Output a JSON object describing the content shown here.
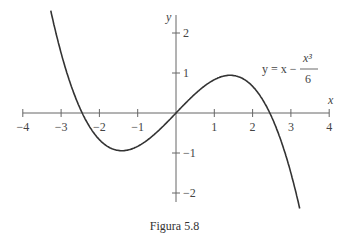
{
  "chart_data": {
    "type": "line",
    "title": "",
    "caption": "Figura 5.8",
    "function": "y = x - x^3/6",
    "annotation": {
      "lhs": "y = x −",
      "numerator": "x³",
      "denominator": "6"
    },
    "xlabel": "x",
    "ylabel": "y",
    "xlim": [
      -4,
      4
    ],
    "ylim": [
      -2.5,
      2.5
    ],
    "x_ticks": [
      -4,
      -3,
      -2,
      -1,
      1,
      2,
      3,
      4
    ],
    "x_tick_labels": [
      "−4",
      "−3",
      "−2",
      "−1",
      "1",
      "2",
      "3",
      "4"
    ],
    "y_ticks": [
      2,
      1,
      -1,
      -2
    ],
    "y_tick_labels": [
      "2",
      "1",
      "−1",
      "−2"
    ],
    "grid": false,
    "series": [
      {
        "name": "y = x - x^3/6",
        "x": [
          -3.25,
          -3,
          -2.5,
          -2,
          -1.414,
          -1,
          -0.5,
          0,
          0.5,
          1,
          1.414,
          2,
          2.5,
          3,
          3.25
        ],
        "y": [
          2.47,
          1.5,
          0.1,
          -0.67,
          -0.943,
          -0.833,
          -0.479,
          0,
          0.479,
          0.833,
          0.943,
          0.667,
          -0.104,
          -1.5,
          -2.47
        ]
      }
    ]
  },
  "figure": {
    "caption": "Figura 5.8"
  }
}
